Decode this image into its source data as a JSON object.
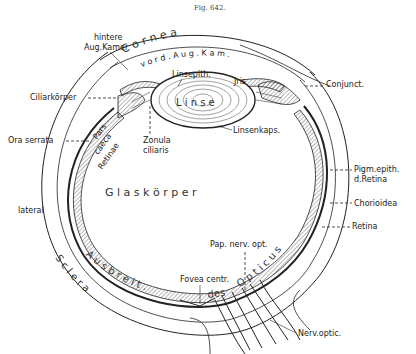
{
  "figure": {
    "caption": "Fig. 642.",
    "colors": {
      "ink": "#222222",
      "paper": "#ffffff"
    }
  },
  "large_labels": {
    "cornea": "C o r n e a",
    "vord_aug_kam": "v o r d . A u g . K a m .",
    "linse": "L i n s e",
    "glaskoerper": "G l a s k ö r p e r",
    "sclera": "S c l e r a",
    "ausbreit": "A u s b r e i t .",
    "des": "des",
    "opticus": "O p t i c u s",
    "pars": "Pars",
    "caeca": "caeca",
    "retinae": "Retinae",
    "iris": "Jris"
  },
  "labels": {
    "hintere_line1": "hintere",
    "hintere_line2": "Aug.Kamer",
    "ciliarkoerper": "Ciliarkörper",
    "ora_serrata": "Ora serrata",
    "lateral": "lateral",
    "linsepith": "Linsepith.",
    "linsenkaps": "Linsenkaps.",
    "zonula_line1": "Zonula",
    "zonula_line2": "ciliaris",
    "conjunct": "Conjunct.",
    "pigm_line1": "Pigm.epith.",
    "pigm_line2": "d.Retina",
    "chorioidea": "Chorioidea",
    "retina": "Retina",
    "pap_nerv_opt": "Pap. nerv. opt.",
    "fovea_centr": "Fovea centr.",
    "nerv_optic": "Nerv.optic."
  }
}
